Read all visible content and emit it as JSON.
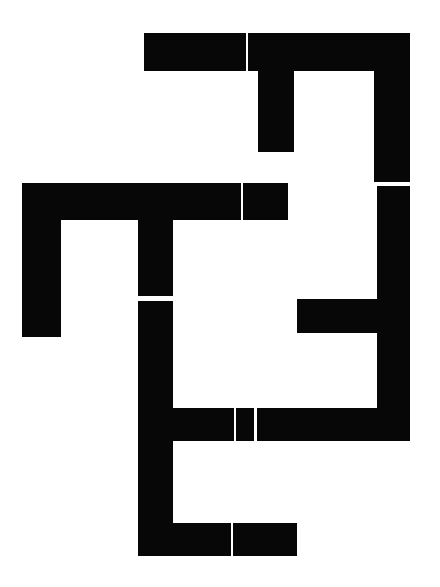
{
  "artwork": {
    "title": "Abstract Geometric Composition",
    "description": "Maze-like arrangement of thick black orthogonal bars on a white field",
    "canvas": {
      "width": 440,
      "height": 587,
      "background_color": "#ffffff"
    },
    "ink_color": "#070707",
    "seam_color": "#ffffff",
    "stroke_thickness_px": 36,
    "shape_count": 14,
    "seam_count": 9
  },
  "shapes": [
    {
      "name": "top-horizontal-bar",
      "x": 144,
      "y": 33,
      "w": 266,
      "h": 38
    },
    {
      "name": "top-right-vertical-bar",
      "x": 374,
      "y": 33,
      "w": 36,
      "h": 150
    },
    {
      "name": "upper-inner-vertical-stub",
      "x": 258,
      "y": 60,
      "w": 36,
      "h": 92
    },
    {
      "name": "middle-horizontal-bar",
      "x": 22,
      "y": 183,
      "w": 266,
      "h": 37
    },
    {
      "name": "left-vertical-bar",
      "x": 22,
      "y": 220,
      "w": 39,
      "h": 117
    },
    {
      "name": "center-upper-vertical-bar",
      "x": 138,
      "y": 220,
      "w": 35,
      "h": 78
    },
    {
      "name": "right-lower-vertical-bar",
      "x": 377,
      "y": 186,
      "w": 33,
      "h": 255
    },
    {
      "name": "right-inner-horizontal-stub",
      "x": 297,
      "y": 299,
      "w": 80,
      "h": 34
    },
    {
      "name": "center-lower-vertical-bar",
      "x": 138,
      "y": 301,
      "w": 35,
      "h": 255
    },
    {
      "name": "lower-horizontal-bar",
      "x": 173,
      "y": 408,
      "w": 237,
      "h": 33
    },
    {
      "name": "bottom-horizontal-bar",
      "x": 173,
      "y": 523,
      "w": 124,
      "h": 33
    }
  ],
  "seams": [
    {
      "name": "seam-top-bar-vertical",
      "x": 246,
      "y": 33,
      "w": 2,
      "h": 38
    },
    {
      "name": "seam-right-bar-horizontal",
      "x": 374,
      "y": 182,
      "w": 36,
      "h": 4
    },
    {
      "name": "seam-middle-bar-vertical",
      "x": 241,
      "y": 183,
      "w": 2,
      "h": 37
    },
    {
      "name": "seam-center-vertical-gap",
      "x": 138,
      "y": 296,
      "w": 35,
      "h": 5
    },
    {
      "name": "seam-lower-bar-vertical-a",
      "x": 234,
      "y": 408,
      "w": 2,
      "h": 33
    },
    {
      "name": "seam-lower-bar-vertical-b",
      "x": 254,
      "y": 408,
      "w": 3,
      "h": 33
    },
    {
      "name": "seam-bottom-bar-vertical",
      "x": 231,
      "y": 523,
      "w": 2,
      "h": 33
    }
  ]
}
